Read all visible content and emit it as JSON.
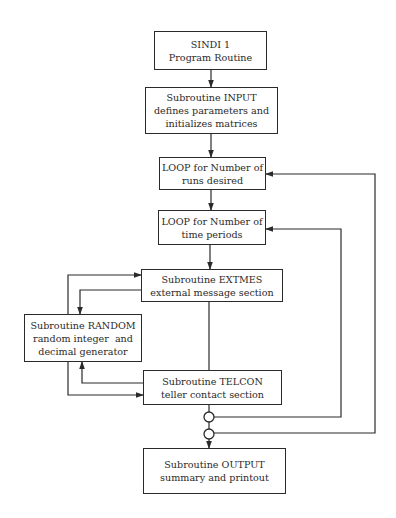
{
  "diagram": {
    "type": "flowchart",
    "colors": {
      "line": "#2a2a2a",
      "background": "#ffffff"
    },
    "nodes": [
      {
        "id": "sindi",
        "lines": [
          "SINDI 1",
          "Program Routine"
        ]
      },
      {
        "id": "input",
        "lines": [
          "Subroutine INPUT",
          "defines parameters and",
          "initializes matrices"
        ]
      },
      {
        "id": "loop_runs",
        "lines": [
          "LOOP for Number of",
          "runs desired"
        ]
      },
      {
        "id": "loop_time",
        "lines": [
          "LOOP for Number of",
          "time periods"
        ]
      },
      {
        "id": "extmes",
        "lines": [
          "Subroutine EXTMES",
          "external message section"
        ]
      },
      {
        "id": "random",
        "lines": [
          "Subroutine RANDOM",
          "random integer  and",
          "decimal generator"
        ]
      },
      {
        "id": "telcon",
        "lines": [
          "Subroutine TELCON",
          "teller contact section"
        ]
      },
      {
        "id": "output",
        "lines": [
          "Subroutine OUTPUT",
          "summary and printout"
        ]
      }
    ],
    "edges": [
      {
        "from": "sindi",
        "to": "input"
      },
      {
        "from": "input",
        "to": "loop_runs"
      },
      {
        "from": "loop_runs",
        "to": "loop_time"
      },
      {
        "from": "loop_time",
        "to": "extmes"
      },
      {
        "from": "random",
        "to": "extmes"
      },
      {
        "from": "extmes",
        "to": "random"
      },
      {
        "from": "extmes",
        "to": "telcon"
      },
      {
        "from": "random",
        "to": "telcon"
      },
      {
        "from": "telcon",
        "to": "random"
      },
      {
        "from": "telcon",
        "to": "junction_1"
      },
      {
        "from": "junction_1",
        "to": "loop_time",
        "label": "repeat time periods"
      },
      {
        "from": "junction_1",
        "to": "junction_2"
      },
      {
        "from": "junction_2",
        "to": "loop_runs",
        "label": "repeat runs"
      },
      {
        "from": "junction_2",
        "to": "output"
      }
    ]
  }
}
